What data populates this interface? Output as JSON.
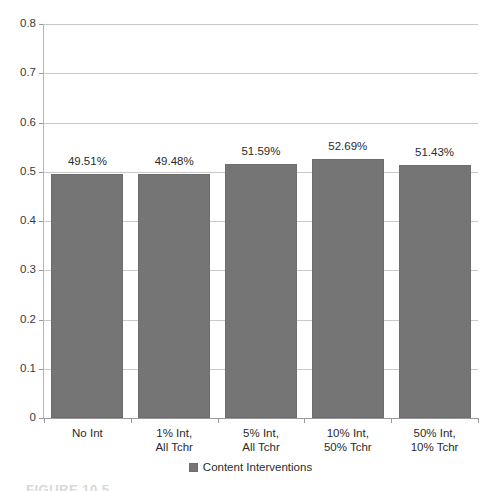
{
  "chart_data": {
    "type": "bar",
    "title": "",
    "xlabel": "",
    "ylabel": "",
    "categories": [
      "No Int",
      "1% Int, All Tchr",
      "5% Int, All Tchr",
      "10% Int, 50% Tchr",
      "50% Int, 10% Tchr"
    ],
    "category_lines": [
      [
        "No Int"
      ],
      [
        "1% Int,",
        "All Tchr"
      ],
      [
        "5% Int,",
        "All Tchr"
      ],
      [
        "10% Int,",
        "50% Tchr"
      ],
      [
        "50% Int,",
        "10% Tchr"
      ]
    ],
    "values": [
      0.4951,
      0.4948,
      0.5159,
      0.5269,
      0.5143
    ],
    "data_labels": [
      "49.51%",
      "49.48%",
      "51.59%",
      "52.69%",
      "51.43%"
    ],
    "series": [
      {
        "name": "Content Interventions",
        "values": [
          0.4951,
          0.4948,
          0.5159,
          0.5269,
          0.5143
        ],
        "color": "#757575"
      }
    ],
    "ylim": [
      0,
      0.8
    ],
    "ytick_values": [
      0,
      0.1,
      0.2,
      0.3,
      0.4,
      0.5,
      0.6,
      0.7,
      0.8
    ],
    "ytick_labels": [
      "0",
      "0.1",
      "0.2",
      "0.3",
      "0.4",
      "0.5",
      "0.6",
      "0.7",
      "0.8"
    ],
    "grid": "horizontal",
    "legend_position": "bottom-center"
  },
  "legend": {
    "entries": [
      {
        "label": "Content Interventions",
        "color": "#757575"
      }
    ]
  },
  "caption": {
    "cut_off_text": "FIGURE 10.5"
  },
  "colors": {
    "bar_fill": "#757575",
    "bar_stroke": "#6d6d6d",
    "gridline": "#c9c9c9",
    "axis": "#9a9a9a",
    "text": "#2b2b2b",
    "background": "#ffffff"
  }
}
